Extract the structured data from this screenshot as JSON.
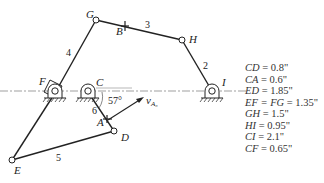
{
  "diagram": {
    "type": "mechanism-linkage",
    "joints": {
      "G": "G",
      "B": "B",
      "H": "H",
      "I": "I",
      "F": "F",
      "C": "C",
      "A": "A",
      "D": "D",
      "E": "E"
    },
    "links": {
      "l2": "2",
      "l3": "3",
      "l4": "4",
      "l5": "5",
      "l6": "6"
    },
    "angle_label": "57°",
    "velocity_label_main": "v",
    "velocity_label_sub": "A₆",
    "dimensions": [
      {
        "name": "CD",
        "value": " = 0.8\""
      },
      {
        "name": "CA",
        "value": " = 0.6\""
      },
      {
        "name": "ED",
        "value": " = 1.85\""
      },
      {
        "name": "EF = FG",
        "value": " = 1.35\""
      },
      {
        "name": "GH",
        "value": " = 1.5\""
      },
      {
        "name": "HI",
        "value": " = 0.95\""
      },
      {
        "name": "CI",
        "value": " = 2.1\""
      },
      {
        "name": "CF",
        "value": " = 0.65\""
      }
    ]
  }
}
